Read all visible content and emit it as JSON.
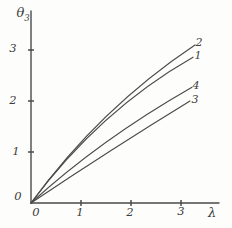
{
  "figure": {
    "style_note": "hand-drawn pencil graph on white paper",
    "background": "#fdfdfc",
    "ink_color": "#4a4a4a",
    "text_color": "#3e3e3e"
  },
  "chart_data": {
    "type": "line",
    "title": "",
    "xlabel": "λ",
    "ylabel": {
      "base": "θ",
      "sub": "3",
      "text": "θ₃"
    },
    "xlim": [
      0,
      3.8
    ],
    "ylim": [
      0,
      3.8
    ],
    "grid": false,
    "legend": "numeric labels at right end of each curve",
    "x_ticks": [
      {
        "v": 0,
        "label": "0",
        "dx": 5,
        "dy": 0
      },
      {
        "v": 1,
        "label": "1",
        "dx": -1,
        "dy": 0
      },
      {
        "v": 2,
        "label": "2",
        "dx": -1,
        "dy": 0
      },
      {
        "v": 3,
        "label": "3",
        "dx": 0,
        "dy": -1
      }
    ],
    "y_ticks": [
      {
        "v": 0,
        "label": "0",
        "dx": 3,
        "dy": -6
      },
      {
        "v": 1,
        "label": "1",
        "dx": 1,
        "dy": 0
      },
      {
        "v": 2,
        "label": "2",
        "dx": -2,
        "dy": 0
      },
      {
        "v": 3,
        "label": "3",
        "dx": -2,
        "dy": -1
      }
    ],
    "points_format": "quadratic bezier [start, control, end] in axis units (λ, θ3); all curves start at origin",
    "series": [
      {
        "name": "1",
        "points": [
          [
            0,
            0
          ],
          [
            1.38,
            1.82
          ],
          [
            3.24,
            2.86
          ]
        ],
        "end_value": [
          3.24,
          2.86
        ],
        "label_pos": [
          3.34,
          2.9
        ]
      },
      {
        "name": "2",
        "points": [
          [
            0,
            0
          ],
          [
            1.38,
            1.86
          ],
          [
            3.28,
            3.1
          ]
        ],
        "end_value": [
          3.28,
          3.1
        ],
        "label_pos": [
          3.36,
          3.16
        ]
      },
      {
        "name": "3",
        "points": [
          [
            0,
            0
          ],
          [
            1.58,
            1.04
          ],
          [
            3.18,
            2.0
          ]
        ],
        "end_value": [
          3.18,
          2.0
        ],
        "label_pos": [
          3.28,
          2.04
        ]
      },
      {
        "name": "4",
        "points": [
          [
            0,
            0
          ],
          [
            1.38,
            1.24
          ],
          [
            3.22,
            2.27
          ]
        ],
        "end_value": [
          3.22,
          2.27
        ],
        "label_pos": [
          3.3,
          2.31
        ]
      }
    ],
    "plot": {
      "origin_px": [
        31,
        203
      ],
      "px_per_x": 50,
      "px_per_y": 51,
      "y_axis_top_px": 11,
      "x_axis_right_px": 219,
      "tick_half_len_px": 3
    }
  }
}
